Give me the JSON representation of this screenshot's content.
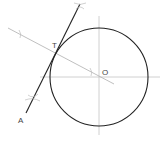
{
  "diagram": {
    "type": "geometric-construction",
    "colors": {
      "circle": "#222222",
      "tangent": "#222222",
      "construction": "#b8b8b8",
      "axes": "#c4c4c4",
      "label": "#444444"
    },
    "labels": {
      "center": "O",
      "tangent_point": "T",
      "external_point": "A"
    },
    "circle": {
      "cx": 99,
      "cy": 77,
      "r": 49
    },
    "points": {
      "O": [
        99,
        77
      ],
      "T": [
        57,
        48
      ],
      "A": [
        26,
        113
      ]
    }
  }
}
